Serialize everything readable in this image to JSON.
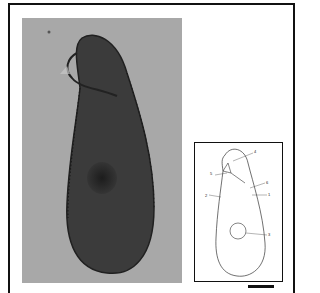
{
  "figure": {
    "photo": {
      "description": "micrograph of ciliate, dorsal/ventral view",
      "background_color": "#a9a9a9",
      "cell_color": "#3a3a3a"
    },
    "drawing": {
      "labels": [
        {
          "id": "label-1",
          "text": "1"
        },
        {
          "id": "label-2",
          "text": "2"
        },
        {
          "id": "label-3",
          "text": "3"
        },
        {
          "id": "label-4",
          "text": "4"
        },
        {
          "id": "label-5",
          "text": "5"
        },
        {
          "id": "label-6",
          "text": "6"
        }
      ]
    },
    "scale_bar": {
      "visible": true
    }
  }
}
